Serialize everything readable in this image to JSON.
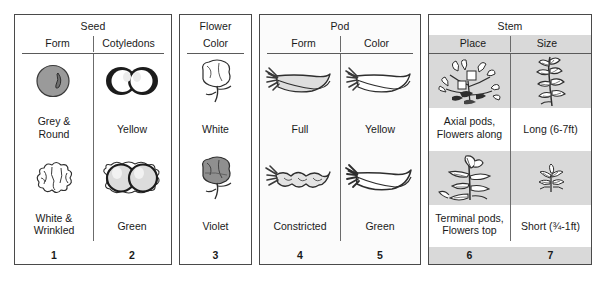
{
  "figure": {
    "panels": [
      {
        "id": "seed",
        "group_title": "Seed",
        "shaded": false,
        "columns": [
          {
            "sub_title": "Form",
            "number": "1",
            "cells": [
              {
                "icon": "round-grey-seed-icon",
                "caption": "Grey &\nRound"
              },
              {
                "icon": "wrinkled-white-seed-icon",
                "caption": "White &\nWrinkled"
              }
            ]
          },
          {
            "sub_title": "Cotyledons",
            "number": "2",
            "cells": [
              {
                "icon": "yellow-cotyledons-icon",
                "caption": "Yellow"
              },
              {
                "icon": "green-cotyledons-icon",
                "caption": "Green"
              }
            ]
          }
        ]
      },
      {
        "id": "flower",
        "group_title": "Flower",
        "shaded": false,
        "columns": [
          {
            "sub_title": "Color",
            "number": "3",
            "cells": [
              {
                "icon": "white-flower-icon",
                "caption": "White"
              },
              {
                "icon": "violet-flower-icon",
                "caption": "Violet"
              }
            ]
          }
        ]
      },
      {
        "id": "pod",
        "group_title": "Pod",
        "shaded": false,
        "columns": [
          {
            "sub_title": "Form",
            "number": "4",
            "cells": [
              {
                "icon": "full-pod-icon",
                "caption": "Full"
              },
              {
                "icon": "constricted-pod-icon",
                "caption": "Constricted"
              }
            ]
          },
          {
            "sub_title": "Color",
            "number": "5",
            "cells": [
              {
                "icon": "yellow-pod-icon",
                "caption": "Yellow"
              },
              {
                "icon": "green-pod-icon",
                "caption": "Green"
              }
            ]
          }
        ]
      },
      {
        "id": "stem",
        "group_title": "Stem",
        "shaded": true,
        "columns": [
          {
            "sub_title": "Place",
            "number": "6",
            "cells": [
              {
                "icon": "axial-flowers-plant-icon",
                "caption": "Axial pods,\nFlowers along"
              },
              {
                "icon": "terminal-flowers-plant-icon",
                "caption": "Terminal pods,\nFlowers top"
              }
            ]
          },
          {
            "sub_title": "Size",
            "number": "7",
            "cells": [
              {
                "icon": "tall-plant-icon",
                "caption": "Long (6-7ft)"
              },
              {
                "icon": "short-plant-icon",
                "caption": "Short (¾-1ft)"
              }
            ]
          }
        ]
      }
    ],
    "colors": {
      "border": "#4a4a4a",
      "rule": "#6b6b6b",
      "shaded_panel_bg": "#d9d9d9",
      "page_bg": "#ffffff",
      "ink": "#1a1a1a",
      "grey_seed_fill": "#9a9a9a",
      "violet_flower_fill": "#8f8f8f",
      "pod_fill": "#dedede"
    }
  }
}
